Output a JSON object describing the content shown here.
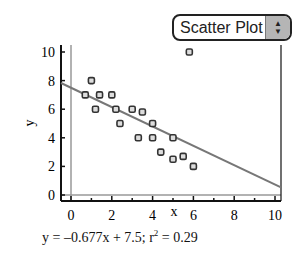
{
  "controls": {
    "plot_type_select": {
      "value": "Scatter Plot",
      "up_arrow": "▲",
      "down_arrow": "▼"
    }
  },
  "equation": {
    "prefix": "y = –0.677x + 7.5; r",
    "sup": "2",
    "suffix": " = 0.29"
  },
  "chart_data": {
    "type": "scatter",
    "title": "",
    "xlabel": "x",
    "ylabel": "y",
    "xlim": [
      -0.5,
      10.5
    ],
    "ylim": [
      -0.6,
      10.5
    ],
    "x_ticks": [
      0,
      2,
      4,
      6,
      8,
      10
    ],
    "y_ticks": [
      0,
      2,
      4,
      6,
      8,
      10
    ],
    "grid": false,
    "series": [
      {
        "name": "data",
        "points": [
          [
            0.7,
            7
          ],
          [
            1,
            8
          ],
          [
            1.2,
            6
          ],
          [
            1.4,
            7
          ],
          [
            2,
            7
          ],
          [
            2.2,
            6
          ],
          [
            2.4,
            5
          ],
          [
            3,
            6
          ],
          [
            3.5,
            5.8
          ],
          [
            3.3,
            4
          ],
          [
            4,
            5
          ],
          [
            4,
            4
          ],
          [
            4.4,
            3
          ],
          [
            5,
            4
          ],
          [
            5,
            2.5
          ],
          [
            5.5,
            2.7
          ],
          [
            6,
            2
          ],
          [
            5.8,
            10
          ]
        ]
      }
    ],
    "regression": {
      "slope": -0.677,
      "intercept": 7.5,
      "r_squared": 0.29
    },
    "reference_lines": {
      "x": 0,
      "y": 0
    }
  }
}
